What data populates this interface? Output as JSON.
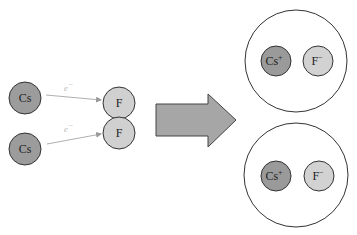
{
  "diagram": {
    "colors": {
      "cs_atom": "#9c9c9c",
      "f_atom": "#d0d0d0",
      "cs_ion": "#9a9a9a",
      "f_ion": "#d2d2d2",
      "stroke": "#333333",
      "electron_arrow": "#b0b0b0",
      "big_arrow_fill": "#a6a6a6",
      "big_arrow_stroke": "#444444",
      "ion_pair_circle": "#ffffff"
    },
    "left": {
      "atoms": [
        {
          "symbol": "Cs",
          "cx": 25,
          "cy": 98,
          "r": 16
        },
        {
          "symbol": "Cs",
          "cx": 25,
          "cy": 149,
          "r": 16
        },
        {
          "symbol": "F",
          "cx": 119,
          "cy": 103,
          "r": 16
        },
        {
          "symbol": "F",
          "cx": 119,
          "cy": 133,
          "r": 16
        }
      ],
      "electron_transfers": [
        {
          "label_base": "e",
          "label_sup": "−",
          "from": [
            46,
            95
          ],
          "to": [
            101,
            100
          ]
        },
        {
          "label_base": "e",
          "label_sup": "−",
          "from": [
            47,
            144
          ],
          "to": [
            101,
            134
          ]
        }
      ]
    },
    "arrow": {
      "direction": "right"
    },
    "right": {
      "ion_pairs": [
        {
          "cation": {
            "base": "Cs",
            "charge": "+"
          },
          "anion": {
            "base": "F",
            "charge": "−"
          }
        },
        {
          "cation": {
            "base": "Cs",
            "charge": "+"
          },
          "anion": {
            "base": "F",
            "charge": "−"
          }
        }
      ]
    }
  }
}
